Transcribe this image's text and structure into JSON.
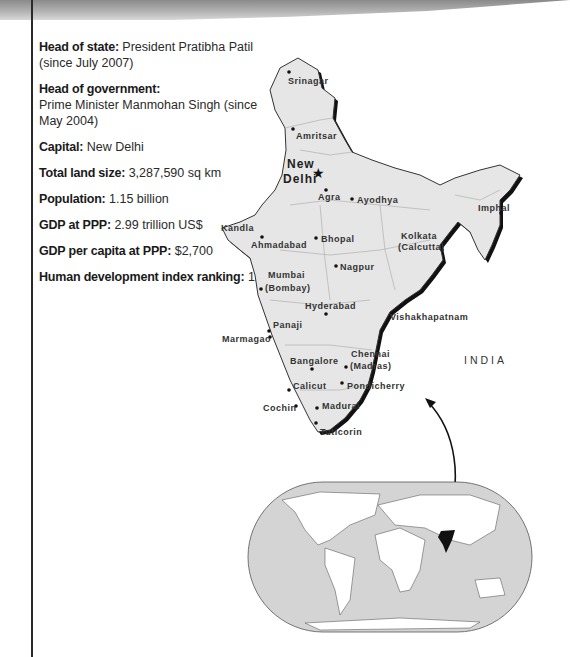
{
  "facts": [
    {
      "label": "Head of state:",
      "value": "President Pratibha Patil (since July 2007)"
    },
    {
      "label": "Head of government:",
      "value": "Prime Minister Manmohan Singh (since May 2004)"
    },
    {
      "label": "Capital:",
      "value": "New Delhi"
    },
    {
      "label": "Total land size:",
      "value": "3,287,590 sq km"
    },
    {
      "label": "Population:",
      "value": "1.15 billion"
    },
    {
      "label": "GDP at PPP:",
      "value": "2.99 trillion US$"
    },
    {
      "label": "GDP per capita at PPP:",
      "value": "$2,700"
    },
    {
      "label": "Human development index ranking:",
      "value": "128"
    }
  ],
  "map": {
    "country_label": "INDIA",
    "capital": {
      "line1": "New",
      "line2": "Delhi",
      "icon": "star-icon"
    },
    "cities": [
      {
        "name": "Srinagar"
      },
      {
        "name": "Amritsar"
      },
      {
        "name": "Agra"
      },
      {
        "name": "Ayodhya"
      },
      {
        "name": "Imphal"
      },
      {
        "name": "Kandla"
      },
      {
        "name": "Ahmadabad"
      },
      {
        "name": "Bhopal"
      },
      {
        "name": "Kolkata"
      },
      {
        "name": "(Calcutta)"
      },
      {
        "name": "Nagpur"
      },
      {
        "name": "Mumbai"
      },
      {
        "name": "(Bombay)"
      },
      {
        "name": "Hyderabad"
      },
      {
        "name": "Vishakhapatnam"
      },
      {
        "name": "Panaji"
      },
      {
        "name": "Marmagao"
      },
      {
        "name": "Bangalore"
      },
      {
        "name": "Chennai"
      },
      {
        "name": "(Madras)"
      },
      {
        "name": "Pondicherry"
      },
      {
        "name": "Calicut"
      },
      {
        "name": "Cochin"
      },
      {
        "name": "Madurai"
      },
      {
        "name": "Tuticorin"
      }
    ],
    "highlight_color": "#111111",
    "land_color": "#e6e6e6",
    "ocean_color": "#d4d4d4"
  }
}
